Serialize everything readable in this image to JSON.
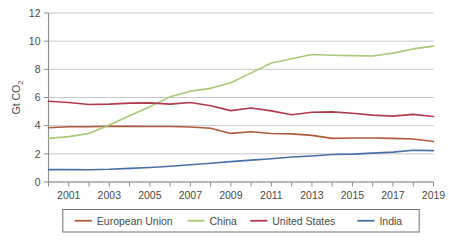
{
  "chart_data": {
    "type": "line",
    "title": "",
    "xlabel": "",
    "ylabel": "Gt CO2",
    "ylabel_main": "Gt CO",
    "ylabel_subscript": "2",
    "xlim": [
      2000,
      2019
    ],
    "ylim": [
      0,
      12
    ],
    "yticks": [
      0,
      2,
      4,
      6,
      8,
      10,
      12
    ],
    "ytick_labels": [
      "0",
      "2",
      "4",
      "6",
      "8",
      "10",
      "12"
    ],
    "xticks": [
      2000,
      2001,
      2002,
      2003,
      2004,
      2005,
      2006,
      2007,
      2008,
      2009,
      2010,
      2011,
      2012,
      2013,
      2014,
      2015,
      2016,
      2017,
      2018,
      2019
    ],
    "xtick_labels_shown": [
      "2001",
      "2003",
      "2005",
      "2007",
      "2009",
      "2011",
      "2013",
      "2015",
      "2017",
      "2019"
    ],
    "grid": true,
    "grid_axis": "y",
    "legend_position": "bottom",
    "x": [
      2000,
      2001,
      2002,
      2003,
      2004,
      2005,
      2006,
      2007,
      2008,
      2009,
      2010,
      2011,
      2012,
      2013,
      2014,
      2015,
      2016,
      2017,
      2018,
      2019
    ],
    "series": [
      {
        "name": "European Union",
        "color": "#b05a3c",
        "values": [
          3.85,
          3.92,
          3.92,
          3.96,
          3.95,
          3.94,
          3.94,
          3.91,
          3.82,
          3.45,
          3.57,
          3.44,
          3.42,
          3.31,
          3.1,
          3.12,
          3.12,
          3.1,
          3.05,
          2.87
        ]
      },
      {
        "name": "China",
        "color": "#a8c977",
        "values": [
          3.1,
          3.22,
          3.45,
          4.05,
          4.7,
          5.35,
          6.05,
          6.45,
          6.65,
          7.05,
          7.75,
          8.45,
          8.75,
          9.05,
          9.0,
          8.97,
          8.95,
          9.15,
          9.45,
          9.65
        ]
      },
      {
        "name": "United States",
        "color": "#b13a4b",
        "values": [
          5.73,
          5.65,
          5.5,
          5.53,
          5.6,
          5.62,
          5.53,
          5.65,
          5.42,
          5.07,
          5.25,
          5.05,
          4.78,
          4.95,
          4.98,
          4.88,
          4.75,
          4.68,
          4.8,
          4.65
        ]
      },
      {
        "name": "India",
        "color": "#4a6fa5",
        "values": [
          0.88,
          0.88,
          0.87,
          0.9,
          0.97,
          1.03,
          1.12,
          1.22,
          1.33,
          1.45,
          1.55,
          1.65,
          1.78,
          1.85,
          1.95,
          1.98,
          2.05,
          2.12,
          2.25,
          2.23
        ]
      }
    ]
  },
  "legend": {
    "items": [
      {
        "label": "European Union",
        "color": "#b05a3c"
      },
      {
        "label": "China",
        "color": "#a8c977"
      },
      {
        "label": "United States",
        "color": "#b13a4b"
      },
      {
        "label": "India",
        "color": "#4a6fa5"
      }
    ]
  },
  "colors": {
    "european_union": "#b05a3c",
    "china": "#a8c977",
    "united_states": "#b13a4b",
    "india": "#4a6fa5",
    "gridline": "#b9b9b9",
    "axis": "#8d8d8d",
    "text": "#4a4a4a",
    "background": "#ffffff"
  }
}
